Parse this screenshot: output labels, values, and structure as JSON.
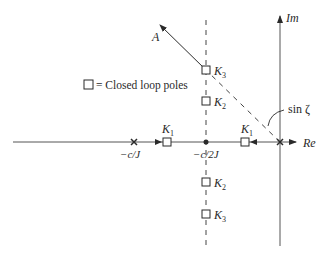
{
  "diagram": {
    "type": "root_locus",
    "axes": {
      "real_label": "Re",
      "imag_label": "Im"
    },
    "legend": {
      "symbol": "square",
      "text": "= Closed loop poles"
    },
    "open_loop_poles": [
      {
        "label": "−c/J",
        "symbol": "x"
      },
      {
        "label": "",
        "symbol": "x",
        "note": "origin"
      }
    ],
    "breakaway_point": {
      "label": "−c/2J",
      "symbol": "dot"
    },
    "closed_loop_poles": [
      {
        "gain": "K",
        "sub": "1",
        "position": "real axis, left branch"
      },
      {
        "gain": "K",
        "sub": "1",
        "position": "real axis, right branch"
      },
      {
        "gain": "K",
        "sub": "2",
        "position": "upper branch"
      },
      {
        "gain": "K",
        "sub": "3",
        "position": "upper branch"
      },
      {
        "gain": "K",
        "sub": "2",
        "position": "lower branch"
      },
      {
        "gain": "K",
        "sub": "3",
        "position": "lower branch"
      }
    ],
    "ray_label": "A",
    "angle_label": "sin ζ",
    "colors": {
      "ink": "#2a2a2a",
      "axis": "#555555",
      "background": "#ffffff"
    }
  },
  "labels": {
    "re": "Re",
    "im": "Im",
    "a": "A",
    "sin_zeta": "sin ζ",
    "neg_c_J": "−c/J",
    "neg_c_2J": "−c/2J",
    "k": "K",
    "sub1": "1",
    "sub2": "2",
    "sub3": "3",
    "legend_text": "= Closed loop poles"
  }
}
